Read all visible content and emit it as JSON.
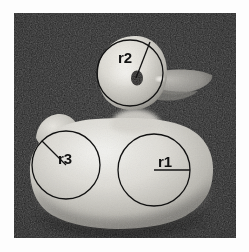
{
  "figure": {
    "type": "annotated-photograph",
    "background_color": "#1a1a1a",
    "page_background": "#ffffff",
    "annotation_color": "#101010",
    "frame": {
      "x": 14,
      "y": 13,
      "width": 222,
      "height": 225
    },
    "annotations": [
      {
        "label": "r2",
        "name": "head-radius-annotation",
        "circle": {
          "cx": 130,
          "cy": 73,
          "r": 33
        },
        "radius_line": {
          "x1": 136,
          "y1": 78,
          "x2": 150,
          "y2": 42
        },
        "label_pos": {
          "x": 118,
          "y": 62
        }
      },
      {
        "label": "r3",
        "name": "tail-radius-annotation",
        "circle": {
          "cx": 66,
          "cy": 165,
          "r": 34
        },
        "radius_line": {
          "x1": 66,
          "y1": 165,
          "x2": 42,
          "y2": 141
        },
        "label_pos": {
          "x": 58,
          "y": 164
        }
      },
      {
        "label": "r1",
        "name": "breast-radius-annotation",
        "circle": {
          "cx": 154,
          "cy": 170,
          "r": 36
        },
        "radius_line": {
          "x1": 154,
          "y1": 170,
          "x2": 190,
          "y2": 170
        },
        "label_pos": {
          "x": 158,
          "y": 167
        }
      }
    ],
    "parts": [
      {
        "name": "duck-body",
        "description": "large rounded body blob"
      },
      {
        "name": "duck-head",
        "description": "rounded head above body"
      },
      {
        "name": "duck-beak",
        "description": "flat wedge beak pointing right"
      },
      {
        "name": "duck-eye",
        "description": "dark oval eye"
      },
      {
        "name": "duck-tail",
        "description": "small bump at upper-left of body"
      }
    ]
  }
}
